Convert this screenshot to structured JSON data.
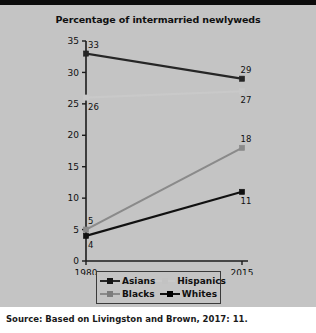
{
  "figure": {
    "title": "Percentage of intermarried newlyweds",
    "source_note": "Source: Based on Livingston and Brown, 2017: 11."
  },
  "colors": {
    "panel_background": "#c4c4c4",
    "page_background": "#ffffff",
    "top_bar": "#0c0c0c",
    "axis": "#1c1c1c",
    "asians": "#262626",
    "hispanics": "#c9c9c9",
    "blacks": "#8a8a8a",
    "whites": "#111111"
  },
  "chart_data": {
    "type": "line",
    "title": "Percentage of intermarried newlyweds",
    "xlabel": "",
    "ylabel": "",
    "x": [
      1980,
      2015
    ],
    "xticklabels": [
      "1980",
      "2015"
    ],
    "xlim": [
      1980,
      2015
    ],
    "ylim": [
      0,
      35
    ],
    "yticks": [
      0,
      5,
      10,
      15,
      20,
      25,
      30,
      35
    ],
    "yticklabels": [
      "0",
      "5",
      "10",
      "15",
      "20",
      "25",
      "30",
      "35"
    ],
    "grid": false,
    "legend_position": "bottom",
    "series": [
      {
        "name": "Asians",
        "values": [
          33,
          29
        ],
        "labels": [
          "33",
          "29"
        ],
        "color": "#262626",
        "label_positions": [
          "above",
          "above"
        ]
      },
      {
        "name": "Hispanics",
        "values": [
          26,
          27
        ],
        "labels": [
          "26",
          "27"
        ],
        "color": "#c9c9c9",
        "label_positions": [
          "below",
          "below"
        ]
      },
      {
        "name": "Blacks",
        "values": [
          5,
          18
        ],
        "labels": [
          "5",
          "18"
        ],
        "color": "#8a8a8a",
        "label_positions": [
          "above",
          "above"
        ]
      },
      {
        "name": "Whites",
        "values": [
          4,
          11
        ],
        "labels": [
          "4",
          "11"
        ],
        "color": "#111111",
        "label_positions": [
          "below",
          "below"
        ]
      }
    ]
  },
  "legend": {
    "rows": [
      [
        {
          "name": "Asians",
          "color": "#262626"
        },
        {
          "name": "Hispanics",
          "color": "#c9c9c9"
        }
      ],
      [
        {
          "name": "Blacks",
          "color": "#8a8a8a"
        },
        {
          "name": "Whites",
          "color": "#111111"
        }
      ]
    ]
  }
}
